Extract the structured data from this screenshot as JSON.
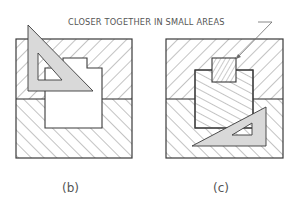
{
  "annotation": {
    "text": "CLOSER TOGETHER IN SMALL AREAS",
    "leader_target": "small-square-in-figure-c"
  },
  "figures": [
    {
      "id": "b",
      "label": "(b)",
      "description": "Sectioned block with stepped opening; 45-degree triangle placed over upper-left for section lining"
    },
    {
      "id": "c",
      "label": "(c)",
      "description": "Sectioned block with stepped opening and small square section; triangle placed in lower-right; small area section lines spaced closer together"
    }
  ],
  "colors": {
    "line": "#3a3a3a",
    "hatch": "#6a6a6a",
    "triangle_fill": "#d9d9d9",
    "text": "#555555"
  }
}
